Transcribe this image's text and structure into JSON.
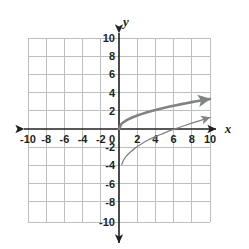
{
  "chart_data": {
    "type": "line",
    "title": "",
    "xlabel": "x",
    "ylabel": "y",
    "xlim": [
      -10,
      10
    ],
    "ylim": [
      -10,
      10
    ],
    "grid": true,
    "grid_step": 2,
    "legend": "none",
    "x_ticks": [
      "-10",
      "-8",
      "-6",
      "-4",
      "-2",
      "0",
      "2",
      "4",
      "6",
      "8",
      "10"
    ],
    "y_ticks": [
      "10",
      "8",
      "6",
      "4",
      "2",
      "-2",
      "-4",
      "-6",
      "-8",
      "-10"
    ],
    "origin_label": "0",
    "series": [
      {
        "name": "upper-curve",
        "color": "#808285",
        "stroke_width": 2.6,
        "arrow_end": true,
        "points": [
          [
            0,
            0
          ],
          [
            0.25,
            0.52
          ],
          [
            0.5,
            0.73
          ],
          [
            1,
            1.04
          ],
          [
            1.5,
            1.27
          ],
          [
            2,
            1.46
          ],
          [
            3,
            1.79
          ],
          [
            4,
            2.07
          ],
          [
            5,
            2.31
          ],
          [
            6,
            2.53
          ],
          [
            7,
            2.73
          ],
          [
            8,
            2.92
          ],
          [
            9,
            3.1
          ],
          [
            10,
            3.27
          ]
        ]
      },
      {
        "name": "lower-curve",
        "color": "#808285",
        "stroke_width": 1.3,
        "arrow_end": true,
        "points": [
          [
            0.3,
            -3.85
          ],
          [
            0.5,
            -3.4
          ],
          [
            0.8,
            -2.95
          ],
          [
            1.2,
            -2.55
          ],
          [
            1.8,
            -2.05
          ],
          [
            2.5,
            -1.6
          ],
          [
            3.2,
            -1.2
          ],
          [
            4,
            -0.82
          ],
          [
            5,
            -0.42
          ],
          [
            6,
            -0.05
          ],
          [
            7,
            0.3
          ],
          [
            8,
            0.63
          ],
          [
            9,
            0.95
          ],
          [
            10,
            1.25
          ]
        ]
      }
    ]
  },
  "axes": {
    "x_axis_label": "x",
    "y_axis_label": "y"
  }
}
